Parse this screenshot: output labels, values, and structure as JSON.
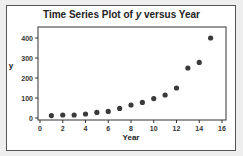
{
  "chart_data": {
    "type": "scatter",
    "title": "Time Series Plot of y versus Year",
    "xlabel": "Year",
    "ylabel": "y",
    "x": [
      1,
      2,
      3,
      4,
      5,
      6,
      7,
      8,
      9,
      10,
      11,
      12,
      13,
      14,
      15
    ],
    "y": [
      12,
      15,
      15,
      20,
      28,
      33,
      48,
      65,
      78,
      97,
      115,
      150,
      250,
      278,
      400
    ],
    "xlim": [
      0,
      16
    ],
    "ylim": [
      0,
      420
    ],
    "x_ticks": [
      0,
      2,
      4,
      6,
      8,
      10,
      12,
      14,
      16
    ],
    "y_ticks": [
      0,
      100,
      200,
      300,
      400
    ],
    "grid": false,
    "legend": null,
    "marker_color": "#3a3a3a"
  }
}
